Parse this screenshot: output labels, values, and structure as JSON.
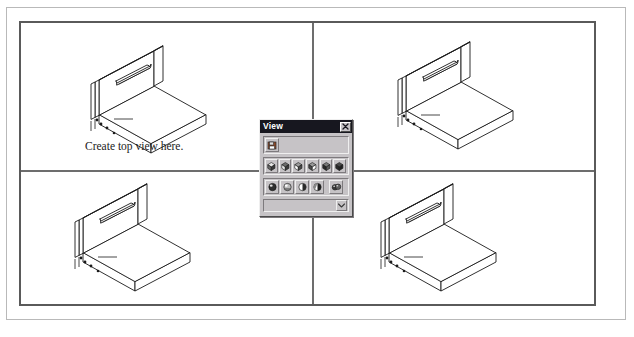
{
  "window": {
    "title": "CAD Multi-View Drawing Sheet"
  },
  "viewport": {
    "panes": [
      {
        "id": "top-left",
        "name": "pane-top-left",
        "hint": "Create top view here.",
        "model": "isometric-l-bracket-with-slot"
      },
      {
        "id": "top-right",
        "name": "pane-top-right",
        "hint": "",
        "model": "isometric-l-bracket-with-slot"
      },
      {
        "id": "bottom-left",
        "name": "pane-bottom-left",
        "hint": "",
        "model": "isometric-l-bracket-with-slot"
      },
      {
        "id": "bottom-right",
        "name": "pane-bottom-right",
        "hint": "",
        "model": "isometric-l-bracket-with-slot"
      }
    ]
  },
  "toolbar": {
    "title": "View",
    "close_label": "×",
    "close_icon": "close-icon",
    "named_views_row": [
      {
        "icon": "named-views-icon",
        "label": "Named Views"
      }
    ],
    "standard_views_row": [
      {
        "icon": "view-top-icon",
        "label": "Top View"
      },
      {
        "icon": "view-bottom-icon",
        "label": "Bottom View"
      },
      {
        "icon": "view-left-icon",
        "label": "Left View"
      },
      {
        "icon": "view-right-icon",
        "label": "Right View"
      },
      {
        "icon": "view-front-icon",
        "label": "Front View"
      },
      {
        "icon": "view-back-icon",
        "label": "Back View"
      }
    ],
    "shading_row": [
      {
        "icon": "shade-2d-wireframe-icon",
        "label": "2D Wireframe"
      },
      {
        "icon": "shade-3d-wireframe-icon",
        "label": "3D Wireframe"
      },
      {
        "icon": "shade-hidden-icon",
        "label": "Hidden"
      },
      {
        "icon": "shade-flat-icon",
        "label": "Flat Shaded"
      },
      {
        "icon": "shade-gouraud-icon",
        "label": "Gouraud Shaded"
      }
    ],
    "combobox": {
      "value": "",
      "placeholder": "",
      "arrow_icon": "chevron-down-icon"
    }
  },
  "colors": {
    "sheet_border": "#b9b9b9",
    "viewport_frame": "#5a5a5a",
    "divider": "#6d6d6d",
    "titlebar_bg": "#17171f",
    "titlebar_text": "#ffffff",
    "palette_face": "#c6c3c6",
    "palette_highlight": "#efefef",
    "palette_shadow": "#7d7a7d",
    "model_line": "#1a1a1a",
    "hint_text": "#1a1a1a"
  }
}
